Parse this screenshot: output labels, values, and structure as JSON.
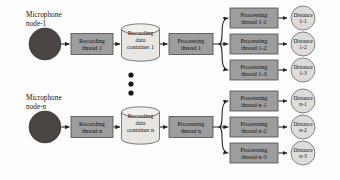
{
  "diagram": {
    "colors": {
      "process_box_fill": "#9d9d9d",
      "process_box_stroke": "#4a4a4a",
      "cylinder_fill": "#e8e6e1",
      "cylinder_stroke": "#5a5a5a",
      "mic_fill": "#4a4542",
      "circle_fill": "#dedcd8",
      "circle_stroke": "#6a6a6a",
      "arrow": "#2a2522",
      "text": "#120f0d",
      "background": "#fdfdfd"
    },
    "ellipsis_dots": 3,
    "rows": [
      {
        "id": "row-1",
        "mic_label": "Microphone\nnode-1",
        "recording_thread": "Recording\nthread 1",
        "data_container": "Recording\ndata\ncontainer 1",
        "processing_thread": "Processing\nthread 1",
        "branches": [
          {
            "processing": "Processing\nthread 1-1",
            "distance": "Distance\n1-1"
          },
          {
            "processing": "Processing\nthread 1-2",
            "distance": "Distance\n1-2"
          },
          {
            "processing": "Processing\nthread 1-3",
            "distance": "Distance\n1-3"
          }
        ]
      },
      {
        "id": "row-n",
        "mic_label": "Microphone\nnode-n",
        "recording_thread": "Recording\nthread n",
        "data_container": "Recording\ndata\ncontainer n",
        "processing_thread": "Processing\nthread n",
        "branches": [
          {
            "processing": "Processing\nthread n-1",
            "distance": "Distance\nn-1"
          },
          {
            "processing": "Processing\nthread n-2",
            "distance": "Distance\nn-2"
          },
          {
            "processing": "Processing\nthread n-3",
            "distance": "Distance\nn-3"
          }
        ]
      }
    ]
  }
}
